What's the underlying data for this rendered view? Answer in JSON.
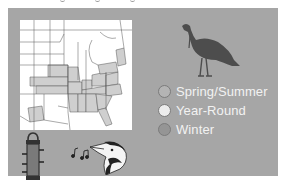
{
  "panel": {
    "background": "#a6a6a6"
  },
  "map": {
    "label": "range-map",
    "fill_colors": {
      "spring_summer": "#c4c4c4",
      "year_round": "#ffffff",
      "winter": "#959595"
    }
  },
  "legend": {
    "items": [
      {
        "label": "Spring/Summer",
        "color": "#b4b4b4"
      },
      {
        "label": "Year-Round",
        "color": "#ececec"
      },
      {
        "label": "Winter",
        "color": "#959595"
      }
    ]
  },
  "icons": {
    "turkey": "turkey-silhouette-icon",
    "feeder": "tube-feeder-icon",
    "song": "music-notes-icon",
    "bird_head": "woodpecker-head-icon"
  }
}
